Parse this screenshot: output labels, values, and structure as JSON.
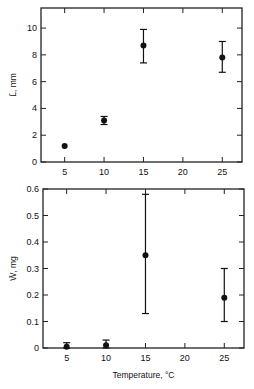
{
  "chart_data": [
    {
      "type": "scatter",
      "title": "",
      "xlabel": "",
      "ylabel": "L̄, mm",
      "x": [
        5,
        10,
        15,
        25
      ],
      "values": [
        1.2,
        3.1,
        8.7,
        7.8
      ],
      "error_low": [
        1.2,
        2.8,
        7.4,
        6.7
      ],
      "error_high": [
        1.2,
        3.4,
        9.9,
        9.0
      ],
      "xlim": [
        2,
        27.5
      ],
      "ylim": [
        0,
        11.5
      ],
      "xticks": [
        "5",
        "10",
        "15",
        "20",
        "25"
      ],
      "yticks": [
        "0",
        "2",
        "4",
        "6",
        "8",
        "10"
      ],
      "grid": false
    },
    {
      "type": "scatter",
      "title": "",
      "xlabel": "Temperature, °C",
      "ylabel": "W̄, mg",
      "x": [
        5,
        10,
        15,
        25
      ],
      "values": [
        0.005,
        0.01,
        0.35,
        0.19
      ],
      "error_low": [
        0.0,
        0.0,
        0.13,
        0.1
      ],
      "error_high": [
        0.02,
        0.03,
        0.58,
        0.3
      ],
      "xlim": [
        2,
        27.5
      ],
      "ylim": [
        0,
        0.6
      ],
      "xticks": [
        "5",
        "10",
        "15",
        "20",
        "25"
      ],
      "yticks": [
        "0",
        "0.1",
        "0.2",
        "0.3",
        "0.4",
        "0.5",
        "0.6"
      ],
      "grid": false
    }
  ]
}
